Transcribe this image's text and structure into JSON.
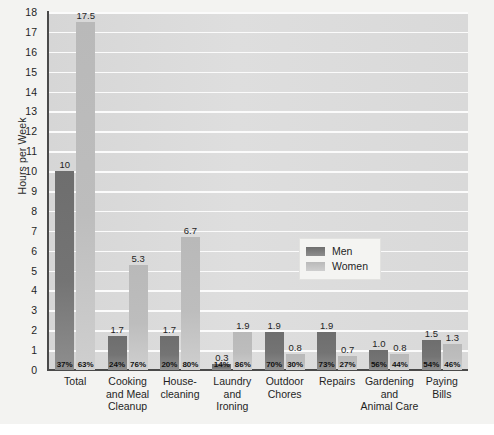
{
  "chart_data": {
    "type": "bar",
    "title": "",
    "xlabel": "",
    "ylabel": "Hours per Week",
    "ylim": [
      0,
      18
    ],
    "ytick_step": 1,
    "yticks": [
      "18",
      "17",
      "16",
      "15",
      "14",
      "13",
      "12",
      "11",
      "10",
      "9",
      "8",
      "7",
      "6",
      "5",
      "4",
      "3",
      "2",
      "1",
      "0"
    ],
    "grid": true,
    "legend_position": "center-right-inside",
    "categories": [
      "Total",
      "Cooking and Meal Cleanup",
      "House-cleaning",
      "Laundry and Ironing",
      "Outdoor Chores",
      "Repairs",
      "Gardening and Animal Care",
      "Paying Bills"
    ],
    "category_lines": [
      [
        "Total"
      ],
      [
        "Cooking",
        "and Meal",
        "Cleanup"
      ],
      [
        "House-",
        "cleaning"
      ],
      [
        "Laundry",
        "and",
        "Ironing"
      ],
      [
        "Outdoor",
        "Chores"
      ],
      [
        "Repairs"
      ],
      [
        "Gardening",
        "and",
        "Animal Care"
      ],
      [
        "Paying",
        "Bills"
      ]
    ],
    "series": [
      {
        "name": "Men",
        "color": "#747474",
        "values": [
          10,
          1.7,
          1.7,
          0.3,
          1.9,
          1.9,
          1.0,
          1.5
        ],
        "value_labels": [
          "10",
          "1.7",
          "1.7",
          "0.3",
          "1.9",
          "1.9",
          "1.0",
          "1.5"
        ],
        "percent_labels": [
          "37%",
          "24%",
          "20%",
          "14%",
          "70%",
          "73%",
          "56%",
          "54%"
        ]
      },
      {
        "name": "Women",
        "color": "#bdbdbd",
        "values": [
          17.5,
          5.3,
          6.7,
          1.9,
          0.8,
          0.7,
          0.8,
          1.3
        ],
        "value_labels": [
          "17.5",
          "5.3",
          "6.7",
          "1.9",
          "0.8",
          "0.7",
          "0.8",
          "1.3"
        ],
        "percent_labels": [
          "63%",
          "76%",
          "80%",
          "86%",
          "30%",
          "27%",
          "44%",
          "46%"
        ]
      }
    ]
  },
  "legend": {
    "items": [
      {
        "label": "Men",
        "color": "#747474"
      },
      {
        "label": "Women",
        "color": "#bdbdbd"
      }
    ]
  }
}
